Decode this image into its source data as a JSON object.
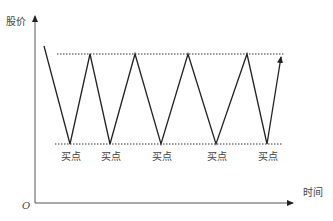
{
  "diagram": {
    "y_axis_label": "股价",
    "x_axis_label": "时间",
    "origin_label": "O",
    "buy_point_label": "买点",
    "buy_points": [
      {
        "x": 70,
        "label": "买点"
      },
      {
        "x": 110,
        "label": "买点"
      },
      {
        "x": 161,
        "label": "买点"
      },
      {
        "x": 216,
        "label": "买点"
      },
      {
        "x": 267,
        "label": "买点"
      }
    ],
    "resistance_line": {
      "y": 54,
      "x1": 57,
      "x2": 284
    },
    "support_line": {
      "y": 144,
      "x1": 55,
      "x2": 282
    },
    "price_path": [
      [
        44,
        46
      ],
      [
        70,
        144
      ],
      [
        90,
        54
      ],
      [
        110,
        144
      ],
      [
        135,
        54
      ],
      [
        161,
        144
      ],
      [
        188,
        54
      ],
      [
        216,
        144
      ],
      [
        247,
        54
      ],
      [
        267,
        144
      ],
      [
        282,
        54
      ]
    ],
    "colors": {
      "line": "#222222",
      "dotted": "#333333",
      "axis": "#555555",
      "text": "#444444"
    }
  }
}
